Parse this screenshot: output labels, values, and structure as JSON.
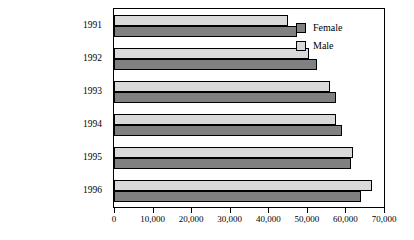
{
  "chart_data": {
    "type": "bar",
    "orientation": "horizontal",
    "title": "",
    "xlabel": "",
    "ylabel": "",
    "categories": [
      "1991",
      "1992",
      "1993",
      "1994",
      "1995",
      "1996"
    ],
    "series": [
      {
        "name": "Female",
        "color": "#808080",
        "values": [
          47500,
          52500,
          57500,
          59000,
          61500,
          64000
        ]
      },
      {
        "name": "Male",
        "color": "#d9d9d9",
        "values": [
          45000,
          50500,
          56000,
          57500,
          62000,
          67000
        ]
      }
    ],
    "xlim": [
      0,
      70000
    ],
    "xticks": [
      0,
      10000,
      20000,
      30000,
      40000,
      50000,
      60000,
      70000
    ],
    "xtick_labels": [
      "0",
      "10,000",
      "20,000",
      "30,000",
      "40,000",
      "50,000",
      "60,000",
      "70,000"
    ],
    "grid": false,
    "legend_position": "inside-top-right",
    "frame": true
  },
  "legend": {
    "entries": [
      {
        "label": "Female",
        "swatch": "female-swatch"
      },
      {
        "label": "Male",
        "swatch": "male-swatch"
      }
    ]
  }
}
